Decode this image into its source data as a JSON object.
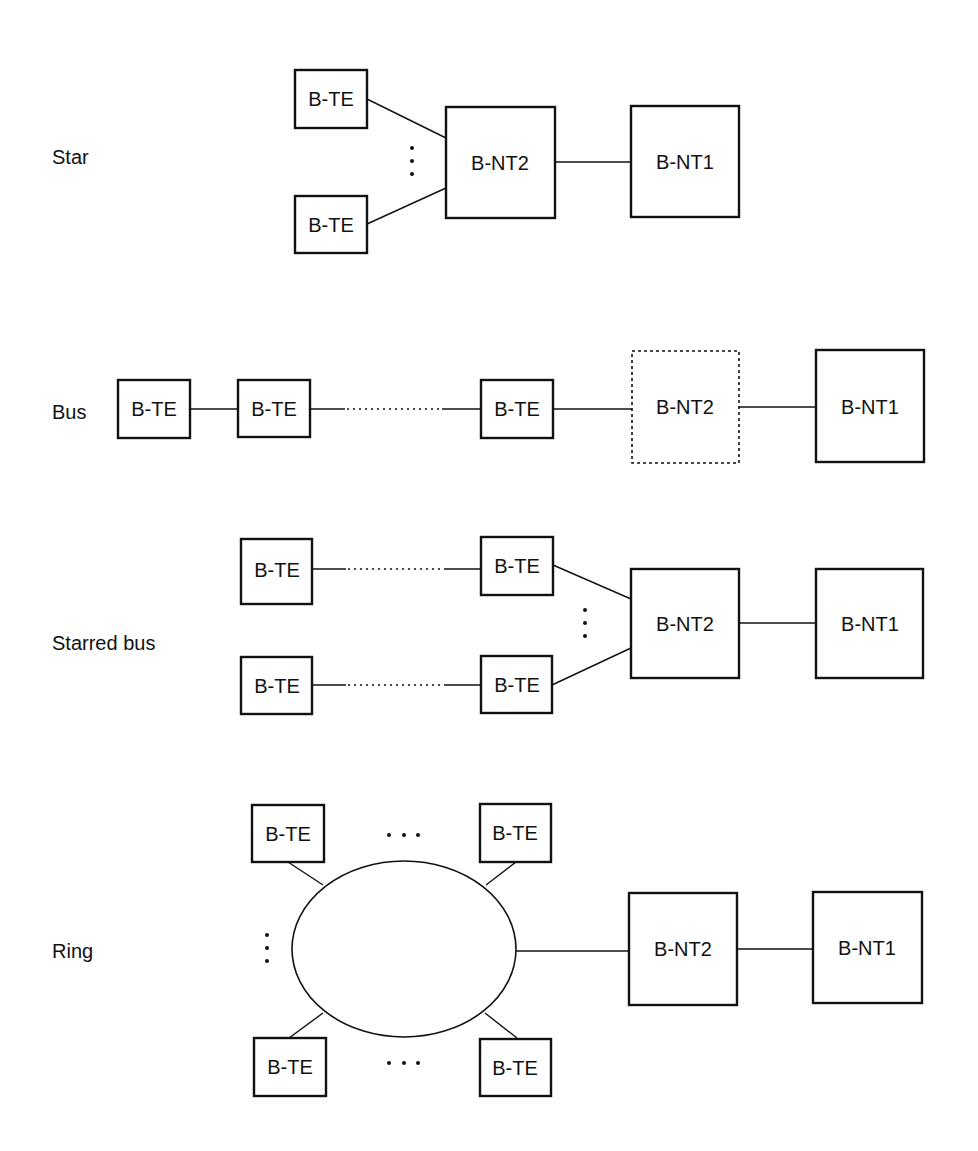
{
  "sections": {
    "star": {
      "label": "Star",
      "te_top": "B-TE",
      "te_bottom": "B-TE",
      "nt2": "B-NT2",
      "nt1": "B-NT1"
    },
    "bus": {
      "label": "Bus",
      "te_1": "B-TE",
      "te_2": "B-TE",
      "te_3": "B-TE",
      "nt2": "B-NT2",
      "nt2_style": "dashed (optional)",
      "nt1": "B-NT1"
    },
    "starred_bus": {
      "label": "Starred bus",
      "te_top_left": "B-TE",
      "te_top_right": "B-TE",
      "te_bottom_left": "B-TE",
      "te_bottom_right": "B-TE",
      "nt2": "B-NT2",
      "nt1": "B-NT1"
    },
    "ring": {
      "label": "Ring",
      "te_top_left": "B-TE",
      "te_top_right": "B-TE",
      "te_bottom_left": "B-TE",
      "te_bottom_right": "B-TE",
      "nt2": "B-NT2",
      "nt1": "B-NT1"
    }
  }
}
